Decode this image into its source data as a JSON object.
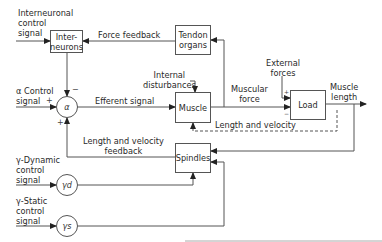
{
  "diagram": {
    "blocks": {
      "interneurons": "Inter-\nneurons",
      "interneurons_l1": "Inter-",
      "interneurons_l2": "neurons",
      "tendon_organs_l1": "Tendon",
      "tendon_organs_l2": "organs",
      "muscle": "Muscle",
      "load": "Load",
      "spindles": "Spindles"
    },
    "junctions": {
      "alpha": "α",
      "gamma_dynamic": "γd",
      "gamma_static": "γs"
    },
    "inputs": {
      "interneuronal_l1": "Interneuronal",
      "interneuronal_l2": "control",
      "interneuronal_l3": "signal",
      "alpha_l1": "α Control",
      "alpha_l2": "signal",
      "gamma_dynamic_l1": "γ-Dynamic",
      "gamma_dynamic_l2": "control",
      "gamma_dynamic_l3": "signal",
      "gamma_static_l1": "γ-Static",
      "gamma_static_l2": "control",
      "gamma_static_l3": "signal",
      "internal_l1": "Internal",
      "internal_l2": "disturbances",
      "external_l1": "External",
      "external_l2": "forces"
    },
    "signals": {
      "force_feedback": "Force feedback",
      "efferent_signal": "Efferent signal",
      "muscular_force_l1": "Muscular",
      "muscular_force_l2": "force",
      "length_and_velocity": "Length and velocity",
      "lv_feedback_l1": "Length and velocity",
      "lv_feedback_l2": "feedback",
      "muscle_length_l1": "Muscle",
      "muscle_length_l2": "length"
    },
    "signs": {
      "alpha_left": "+",
      "alpha_top": "−",
      "alpha_bottom": "+",
      "load_top": "+",
      "load_bottom": "−"
    },
    "colors": {
      "line": "#555555",
      "text": "#2a2a2a",
      "background": "#ffffff"
    }
  }
}
